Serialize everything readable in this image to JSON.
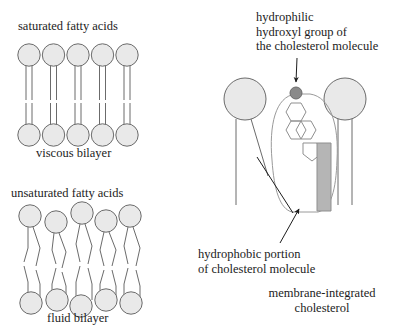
{
  "figure": {
    "title_absent": true,
    "background_color": "#ffffff",
    "stroke_color": "#6b6b6b",
    "head_fill_color": "#e9e9e9",
    "hydroxyl_fill_color": "#8a8a8a",
    "tail_block_fill_color": "#b5b5b5",
    "text_color": "#1c1c1c"
  },
  "panels": {
    "saturated": {
      "heading": "saturated fatty acids",
      "caption": "viscous bilayer",
      "lipid_count_per_leaflet": 5,
      "tails_per_lipid": 2,
      "tail_shape": "straight"
    },
    "unsaturated": {
      "heading": "unsaturated fatty acids",
      "caption": "fluid bilayer",
      "lipid_count_per_leaflet": 5,
      "tails_per_lipid": 2,
      "tail_shape": "kinked"
    },
    "cholesterol": {
      "label_hydrophilic": "hydrophilic\nhydroxyl group of\nthe cholesterol molecule",
      "label_hydrophobic": "hydrophobic portion\nof cholesterol molecule",
      "caption": "membrane-integrated\ncholesterol",
      "ring_count": 3,
      "pentagon_count": 1,
      "flanking_lipid_count": 2
    }
  }
}
